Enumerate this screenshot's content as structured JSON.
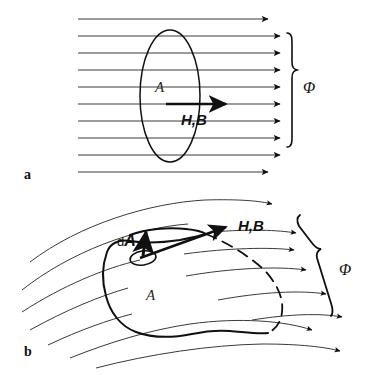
{
  "figure": {
    "background_color": "#ffffff",
    "ink_color": "#101010",
    "field_line_color": "#3a3a3a"
  },
  "panel_a": {
    "caption": "a",
    "area_label": "A",
    "field_label": "H,B",
    "flux_label": "Φ",
    "description": "Uniform field lines crossing a flat area A",
    "field_line_count": 9
  },
  "panel_b": {
    "caption": "b",
    "area_label": "A",
    "element_label_prefix": "d",
    "element_label_vector": "A",
    "field_label": "H,B",
    "flux_label": "Φ",
    "description": "Curved field lines crossing an arbitrary surface A with normal element dA",
    "field_line_count": 8
  }
}
